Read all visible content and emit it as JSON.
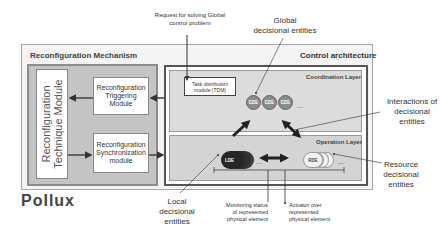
{
  "diagram": {
    "title": "Pollux",
    "reconfiguration_mechanism": {
      "title": "Reconfiguration Mechanism",
      "technique_module": "Reconfiguration Technique Module",
      "technique_module_lines": [
        "Reconfiguration",
        "Technique Module"
      ],
      "triggering_module": [
        "Reconfiguration",
        "Triggering",
        "Module"
      ],
      "synchronization_module": [
        "Reconfiguration",
        "Synchronization",
        "module"
      ]
    },
    "control_architecture": {
      "title": "Control architecture",
      "coordination_layer": {
        "title": "Coordination Layer",
        "task_distribution_module": [
          "Task distribution",
          "module (TDM)"
        ],
        "global_entities": [
          "GDE",
          "GDE",
          "GDE"
        ],
        "ellipsis": "..."
      },
      "operation_layer": {
        "title": "Operation Layer",
        "local_entity": "LDE",
        "resource_entity": "RDE",
        "ellipsis": "..."
      }
    },
    "annotations": {
      "request": [
        "Request for solving Global",
        "control problem"
      ],
      "global": [
        "Global",
        "decisional entities"
      ],
      "interactions": [
        "Interactions of",
        "decisional",
        "entities"
      ],
      "resource": [
        "Resource",
        "decisional",
        "entities"
      ],
      "local": [
        "Local",
        "decisional",
        "entities"
      ],
      "monitoring": [
        "Monitoring status",
        "of represented",
        "physical element"
      ],
      "actuator": [
        "Actuator over",
        "represented",
        "physical element"
      ]
    }
  }
}
